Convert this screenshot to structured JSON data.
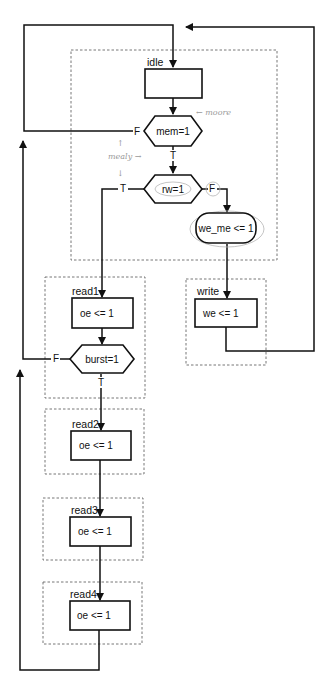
{
  "diagram": {
    "type": "ASM chart (state machine flowchart)",
    "states": [
      {
        "id": "idle",
        "label": "idle",
        "action": ""
      },
      {
        "id": "write",
        "label": "write",
        "action": "we <= 1"
      },
      {
        "id": "read1",
        "label": "read1",
        "action": "oe <= 1"
      },
      {
        "id": "read2",
        "label": "read2",
        "action": "oe <= 1"
      },
      {
        "id": "read3",
        "label": "read3",
        "action": "oe <= 1"
      },
      {
        "id": "read4",
        "label": "read4",
        "action": "oe <= 1"
      }
    ],
    "decisions": [
      {
        "id": "mem",
        "label": "mem=1",
        "true_label": "T",
        "false_label": "F"
      },
      {
        "id": "rw",
        "label": "rw=1",
        "true_label": "T",
        "false_label": "F"
      },
      {
        "id": "burst",
        "label": "burst=1",
        "true_label": "T",
        "false_label": "F"
      }
    ],
    "conditional_outputs": [
      {
        "id": "we_me",
        "label": "we_me <= 1"
      }
    ],
    "annotations": [
      {
        "id": "moore",
        "text": "← moore"
      },
      {
        "id": "mealy",
        "text": "mealy →"
      }
    ],
    "transitions": [
      {
        "from": "idle",
        "to": "mem"
      },
      {
        "from": "mem",
        "to": "idle",
        "on": "F"
      },
      {
        "from": "mem",
        "to": "rw",
        "on": "T"
      },
      {
        "from": "rw",
        "to": "read1",
        "on": "T"
      },
      {
        "from": "rw",
        "to": "we_me",
        "on": "F"
      },
      {
        "from": "we_me",
        "to": "write"
      },
      {
        "from": "write",
        "to": "idle"
      },
      {
        "from": "read1",
        "to": "burst"
      },
      {
        "from": "burst",
        "to": "idle",
        "on": "F"
      },
      {
        "from": "burst",
        "to": "read2",
        "on": "T"
      },
      {
        "from": "read2",
        "to": "read3"
      },
      {
        "from": "read3",
        "to": "read4"
      },
      {
        "from": "read4",
        "to": "idle"
      }
    ]
  }
}
